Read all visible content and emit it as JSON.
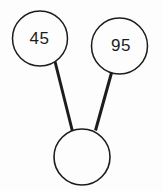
{
  "diagram": {
    "type": "number-bond",
    "nodes": [
      {
        "id": "part-left",
        "label": "45"
      },
      {
        "id": "part-right",
        "label": "95"
      },
      {
        "id": "whole",
        "label": ""
      }
    ],
    "edges": [
      {
        "from": "part-left",
        "to": "whole"
      },
      {
        "from": "part-right",
        "to": "whole"
      }
    ],
    "colors": {
      "stroke": "#1c1c1c",
      "node_fill": "#fdfdfd",
      "text": "#1c1c1c"
    }
  }
}
